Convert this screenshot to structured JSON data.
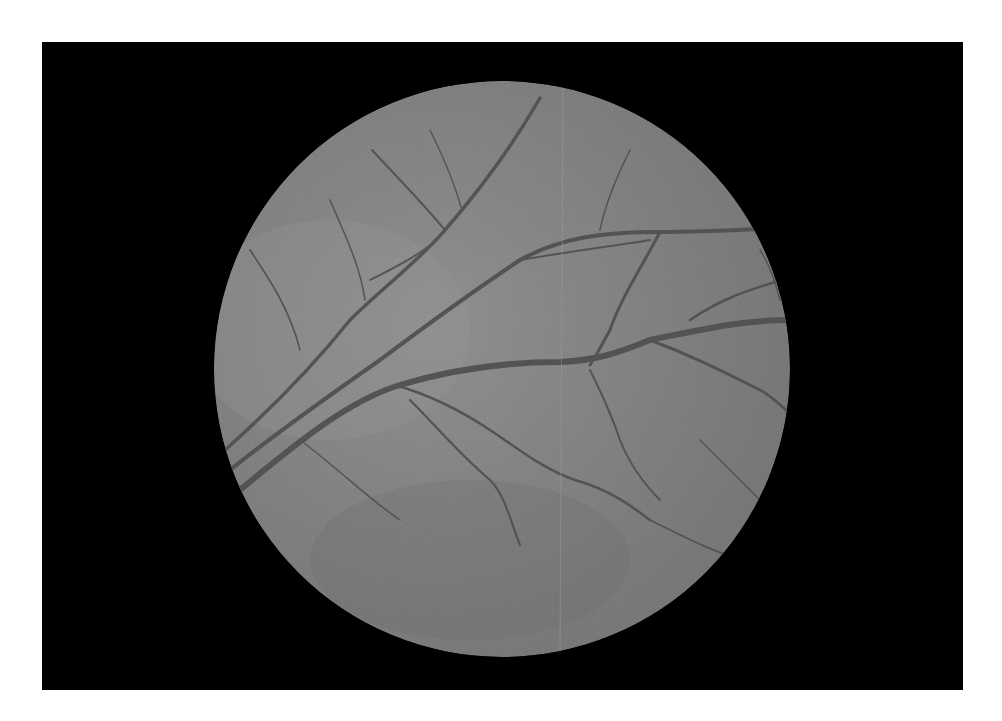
{
  "image": {
    "subject": "retinal fundus photograph (grayscale)",
    "background_color": "#ffffff",
    "frame_color": "#000000",
    "fundus_color": "#7b7b7b",
    "fundus_highlight": "#8a8a8a",
    "vessel_color": "#4a4a4a",
    "frame": {
      "x": 42,
      "y": 42,
      "width": 921,
      "height": 648
    },
    "fundus_circle": {
      "cx": 502,
      "cy": 369,
      "r": 288
    }
  }
}
